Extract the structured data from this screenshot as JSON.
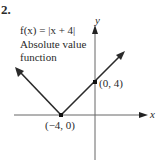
{
  "problem_number": "2.",
  "function_label": "f(x) = |x + 4|",
  "description_line1": "Absolute value",
  "description_line2": "function",
  "axes": {
    "x_label": "x",
    "y_label": "y"
  },
  "points": [
    {
      "label": "(−4, 0)",
      "x": -4,
      "y": 0
    },
    {
      "label": "(0, 4)",
      "x": 0,
      "y": 4
    }
  ],
  "colors": {
    "line": "#2a2a2a",
    "axis": "#555555",
    "background": "#ffffff"
  }
}
